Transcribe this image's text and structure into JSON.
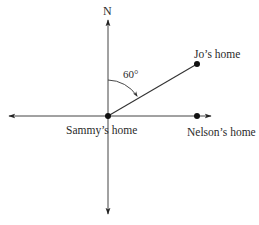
{
  "diagram": {
    "type": "compass-bearing-diagram",
    "compass": {
      "north_label": "N"
    },
    "angle": {
      "value_label": "60°",
      "degrees": 60,
      "measured_from": "N",
      "direction": "clockwise"
    },
    "points": [
      {
        "id": "sammy",
        "label": "Sammy’s home",
        "role": "origin"
      },
      {
        "id": "jo",
        "label": "Jo’s home",
        "bearing_deg": 60
      },
      {
        "id": "nelson",
        "label": "Nelson’s home",
        "bearing_deg": 90
      }
    ],
    "colors": {
      "line": "#333333",
      "dot": "#111111",
      "background": "#ffffff"
    }
  }
}
